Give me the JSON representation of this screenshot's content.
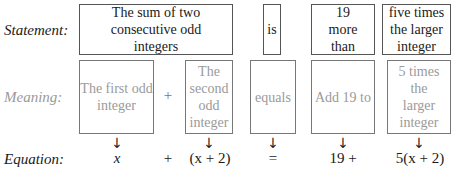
{
  "labels": {
    "statement": "Statement:",
    "meaning": "Meaning:",
    "equation": "Equation:"
  },
  "statement": {
    "boxes": [
      "The sum of two consecutive odd integers",
      "is",
      "19 more than",
      "five times the larger integer"
    ]
  },
  "meaning": {
    "boxes": [
      "The first odd integer",
      "The second odd integer",
      "equals",
      "Add 19 to",
      "5 times the larger integer"
    ],
    "plus": "+"
  },
  "arrows": {
    "glyph": "↓"
  },
  "equation": {
    "terms": [
      "x",
      "+",
      "(x + 2)",
      "=",
      "19 +",
      "5(x + 2)"
    ]
  }
}
